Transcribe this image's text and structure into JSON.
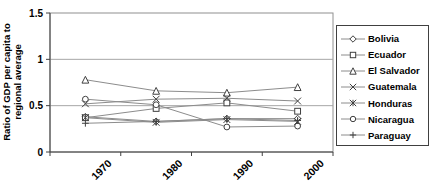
{
  "chart_data": {
    "type": "line",
    "title": "",
    "ylabel_line1": "Ratio of GDP per capita to",
    "ylabel_line2": "regional average",
    "xlabel": "",
    "categories": [
      "1970",
      "1980",
      "1990",
      "2000"
    ],
    "series": [
      {
        "name": "Bolivia",
        "marker": "diamond",
        "values": [
          0.38,
          0.33,
          0.36,
          0.36
        ]
      },
      {
        "name": "Ecuador",
        "marker": "square",
        "values": [
          0.37,
          0.47,
          0.53,
          0.44
        ]
      },
      {
        "name": "El Salvador",
        "marker": "triangle",
        "values": [
          0.78,
          0.66,
          0.64,
          0.7
        ]
      },
      {
        "name": "Guatemala",
        "marker": "x",
        "values": [
          0.52,
          0.57,
          0.58,
          0.55
        ]
      },
      {
        "name": "Honduras",
        "marker": "asterisk",
        "values": [
          0.37,
          0.32,
          0.35,
          0.33
        ]
      },
      {
        "name": "Nicaragua",
        "marker": "circle",
        "values": [
          0.57,
          0.51,
          0.27,
          0.28
        ]
      },
      {
        "name": "Paraguay",
        "marker": "plus",
        "values": [
          0.31,
          0.33,
          0.36,
          0.34
        ]
      }
    ],
    "ylim": [
      0,
      1.5
    ],
    "yticks": [
      "0",
      "0.5",
      "1",
      "1.5"
    ],
    "ytick_values": [
      0,
      0.5,
      1,
      1.5
    ],
    "grid": true,
    "legend_position": "right",
    "colors": {
      "series_line": "#8c8c8c",
      "marker_stroke": "#404040",
      "marker_fill": "#ffffff",
      "gridline": "#a6a6a6",
      "plot_border": "#909090",
      "axis": "#404040",
      "text": "#000000",
      "background": "#ffffff"
    }
  }
}
